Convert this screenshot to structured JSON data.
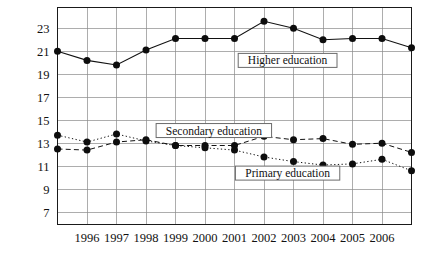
{
  "chart_data": {
    "type": "line",
    "title": "",
    "subtitle": "",
    "xlabel": "",
    "ylabel": "",
    "x": [
      1995,
      1996,
      1997,
      1998,
      1999,
      2000,
      2001,
      2002,
      2003,
      2004,
      2005,
      2006,
      2007
    ],
    "x_tick_labels": [
      "1996",
      "1997",
      "1998",
      "1999",
      "2000",
      "2001",
      "2002",
      "2003",
      "2004",
      "2005",
      "2006"
    ],
    "y_tick_labels": [
      "23",
      "21",
      "19",
      "17",
      "15",
      "13",
      "11",
      "9",
      "7"
    ],
    "y_ticks": [
      23,
      21,
      19,
      17,
      15,
      13,
      11,
      9,
      7
    ],
    "ylim": [
      6,
      24
    ],
    "grid": true,
    "legend_position": "inline-annotations",
    "series": [
      {
        "name": "Higher education",
        "style": "solid",
        "values": [
          21.0,
          20.2,
          19.8,
          21.1,
          22.1,
          22.1,
          22.1,
          23.6,
          23.0,
          22.0,
          22.1,
          22.1,
          21.3
        ]
      },
      {
        "name": "Secondary education",
        "style": "dashed",
        "values": [
          12.5,
          12.4,
          13.1,
          13.3,
          12.8,
          12.8,
          12.8,
          13.6,
          13.3,
          13.4,
          12.9,
          13.0,
          12.2
        ]
      },
      {
        "name": "Primary education",
        "style": "dotted",
        "values": [
          13.7,
          13.1,
          13.8,
          13.2,
          12.8,
          12.6,
          12.4,
          11.8,
          11.4,
          11.1,
          11.2,
          11.6,
          10.6
        ]
      }
    ],
    "annotations": [
      {
        "text": "Higher education",
        "x": 2002.8,
        "y": 20.2
      },
      {
        "text": "Secondary education",
        "x": 2000.3,
        "y": 14.1
      },
      {
        "text": "Primary education",
        "x": 2002.8,
        "y": 10.4
      }
    ],
    "colors": {
      "line": "#111111",
      "marker": "#0d0d0d",
      "grid": "#8a8a8a",
      "frame": "#1a1a1a",
      "background": "#ffffff"
    }
  }
}
